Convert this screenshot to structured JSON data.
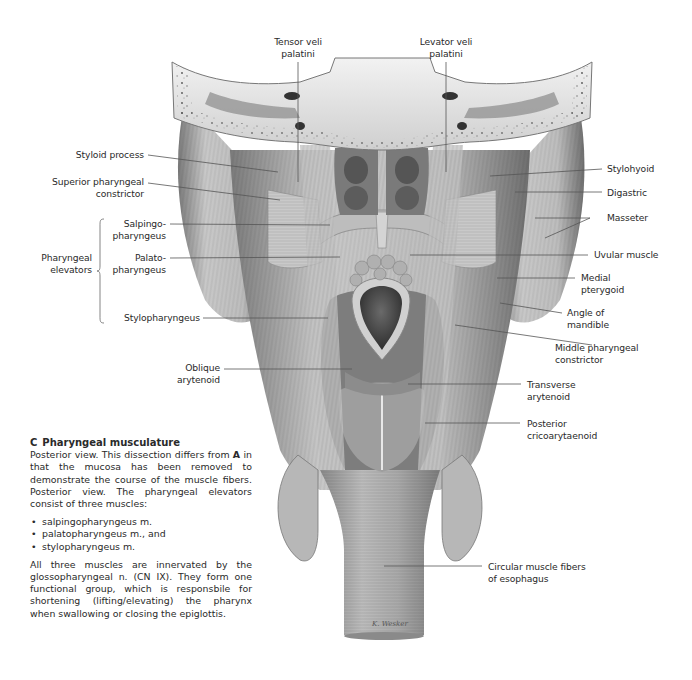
{
  "figure": {
    "labels": {
      "tensor_veli_palatini": "Tensor veli\npalatini",
      "levator_veli_palatini": "Levator veli\npalatini",
      "styloid_process": "Styloid process",
      "superior_pharyngeal_constrictor": "Superior pharyngeal\nconstrictor",
      "salpingopharyngeus": "Salpingo-\npharyngeus",
      "palatopharyngeus": "Palato-\npharyngeus",
      "pharyngeal_elevators": "Pharyngeal\nelevators",
      "stylopharyngeus": "Stylopharyngeus",
      "oblique_arytenoid": "Oblique\narytenoid",
      "stylohyoid": "Stylohyoid",
      "digastric": "Digastric",
      "masseter": "Masseter",
      "uvular_muscle": "Uvular muscle",
      "medial_pterygoid": "Medial\npterygoid",
      "angle_of_mandible": "Angle of\nmandible",
      "middle_pharyngeal_constrictor": "Middle pharyngeal\nconstrictor",
      "transverse_arytenoid": "Transverse\narytenoid",
      "posterior_cricoarytaenoid": "Posterior\ncricoarytaenoid",
      "circular_muscle_fibers": "Circular muscle fibers\nof esophagus"
    },
    "colors": {
      "leader_line": "#555555",
      "text": "#2a2a2a",
      "muscle_light": "#d9d9d9",
      "muscle_mid": "#a8a8a8",
      "muscle_dark": "#5a5a5a",
      "bone": "#e9e9e9"
    }
  },
  "caption": {
    "letter": "C",
    "title": "Pharyngeal musculature",
    "paragraph1_before": "Posterior view. This dissection differs from ",
    "paragraph1_bold": "A",
    "paragraph1_after": " in that the mucosa has been removed to demonstrate the course of the muscle fibers. Posterior view. The pharyngeal elevators consist of three muscles:",
    "bullets": [
      "salpingopharyngeus m.",
      "palatopharyngeus m., and",
      "stylopharyngeus m."
    ],
    "paragraph2": "All three muscles are innervated by the glossopharyngeal n. (CN IX). They form one functional group, which is responsbile for shortening (lifting/elevating) the pharynx when swallowing or closing the epiglottis."
  }
}
